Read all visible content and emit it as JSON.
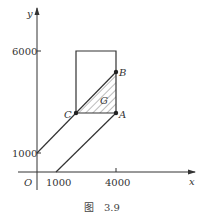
{
  "figure": {
    "caption_prefix": "图",
    "caption_number": "3.9"
  },
  "axes": {
    "x_label": "x",
    "y_label": "y",
    "origin_label": "O",
    "x_ticks": [
      "1000",
      "4000"
    ],
    "y_ticks": [
      "1000",
      "6000"
    ]
  },
  "points": {
    "A": {
      "label": "A",
      "x": 4000,
      "y": 3000
    },
    "B": {
      "label": "B",
      "x": 4000,
      "y": 5000
    },
    "C": {
      "label": "C",
      "x": 2000,
      "y": 3000
    }
  },
  "region_label": "G",
  "colors": {
    "line": "#333333",
    "hatch": "#555555"
  }
}
